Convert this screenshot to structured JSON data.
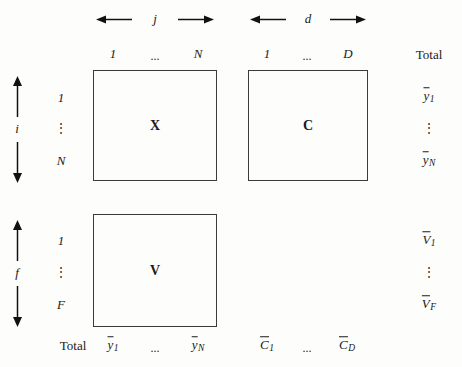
{
  "figure": {
    "type": "matrix-layout-diagram",
    "background_color": "#fdfdfb",
    "line_color": "#3b3b3b",
    "text_color": "#1a1a1a"
  },
  "axes": {
    "top_left": {
      "index_label": "j",
      "left_arrow": "←",
      "right_arrow": "→"
    },
    "top_right": {
      "index_label": "d",
      "left_arrow": "←",
      "right_arrow": "→"
    },
    "side_upper": {
      "index_label": "i",
      "up_arrow": "↑",
      "down_arrow": "↓"
    },
    "side_lower": {
      "index_label": "f",
      "up_arrow": "↑",
      "down_arrow": "↓"
    }
  },
  "column_headers": {
    "block_x": {
      "first": "1",
      "ellipsis": "...",
      "last": "N"
    },
    "block_c": {
      "first": "1",
      "ellipsis": "...",
      "last": "D"
    },
    "total": "Total"
  },
  "row_headers": {
    "upper": {
      "first": "1",
      "ellipsis": "⋮",
      "last": "N"
    },
    "lower": {
      "first": "1",
      "ellipsis": "⋮",
      "last": "F"
    }
  },
  "blocks": [
    {
      "name": "X",
      "row_block": "upper",
      "col_block": "left"
    },
    {
      "name": "C",
      "row_block": "upper",
      "col_block": "right"
    },
    {
      "name": "V",
      "row_block": "lower",
      "col_block": "left"
    }
  ],
  "row_totals": {
    "upper": {
      "first": {
        "base": "y",
        "overbar": true,
        "subscript": "1"
      },
      "ellipsis": "⋮",
      "last": {
        "base": "y",
        "overbar": true,
        "subscript": "N"
      }
    },
    "lower": {
      "first": {
        "base": "V",
        "overbar": true,
        "subscript": "1"
      },
      "ellipsis": "⋮",
      "last": {
        "base": "V",
        "overbar": true,
        "subscript": "F"
      }
    }
  },
  "column_totals": {
    "label": "Total",
    "block_x": {
      "first": {
        "base": "y",
        "overbar": true,
        "subscript": "1"
      },
      "ellipsis": "...",
      "last": {
        "base": "y",
        "overbar": true,
        "subscript": "N"
      }
    },
    "block_c": {
      "first": {
        "base": "C",
        "overbar": true,
        "subscript": "1"
      },
      "ellipsis": "...",
      "last": {
        "base": "C",
        "overbar": true,
        "subscript": "D"
      }
    }
  }
}
